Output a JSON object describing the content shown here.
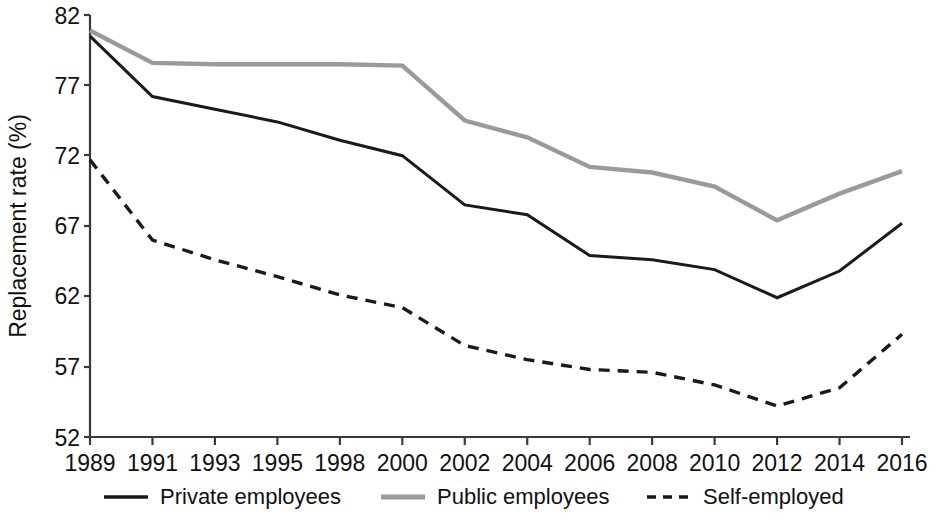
{
  "chart_data": {
    "type": "line",
    "title": "",
    "xlabel": "",
    "ylabel": "Replacement rate (%)",
    "categories": [
      "1989",
      "1991",
      "1993",
      "1995",
      "1998",
      "2000",
      "2002",
      "2004",
      "2006",
      "2008",
      "2010",
      "2012",
      "2014",
      "2016"
    ],
    "x_tick_labels": [
      "1989",
      "1991",
      "1993",
      "1995",
      "1998",
      "2000",
      "2002",
      "2004",
      "2006",
      "2008",
      "2010",
      "2012",
      "2014",
      "2016"
    ],
    "y_tick_labels": [
      "82",
      "77",
      "72",
      "67",
      "62",
      "57",
      "52"
    ],
    "y_ticks": [
      82,
      77,
      72,
      67,
      62,
      57,
      52
    ],
    "ylim": [
      52,
      82
    ],
    "grid": false,
    "legend_position": "bottom",
    "series": [
      {
        "name": "Private employees",
        "style": "solid",
        "color": "#1a1a1a",
        "values": [
          80.5,
          76.2,
          75.3,
          74.4,
          73.1,
          72.0,
          68.5,
          67.8,
          64.9,
          64.6,
          63.9,
          61.9,
          63.8,
          67.2
        ]
      },
      {
        "name": "Public employees",
        "style": "solid",
        "color": "#9a9a9a",
        "values": [
          80.9,
          78.6,
          78.5,
          78.5,
          78.5,
          78.4,
          74.5,
          73.3,
          71.2,
          70.8,
          69.8,
          67.4,
          69.3,
          70.9
        ]
      },
      {
        "name": "Self-employed",
        "style": "dashed",
        "color": "#1a1a1a",
        "values": [
          71.7,
          66.0,
          64.6,
          63.4,
          62.1,
          61.2,
          58.5,
          57.5,
          56.8,
          56.6,
          55.7,
          54.2,
          55.5,
          59.3
        ]
      }
    ],
    "legend": [
      {
        "label": "Private employees",
        "style": "solid",
        "color": "#1a1a1a"
      },
      {
        "label": "Public employees",
        "style": "solid",
        "color": "#9a9a9a"
      },
      {
        "label": "Self-employed",
        "style": "dashed",
        "color": "#1a1a1a"
      }
    ]
  }
}
